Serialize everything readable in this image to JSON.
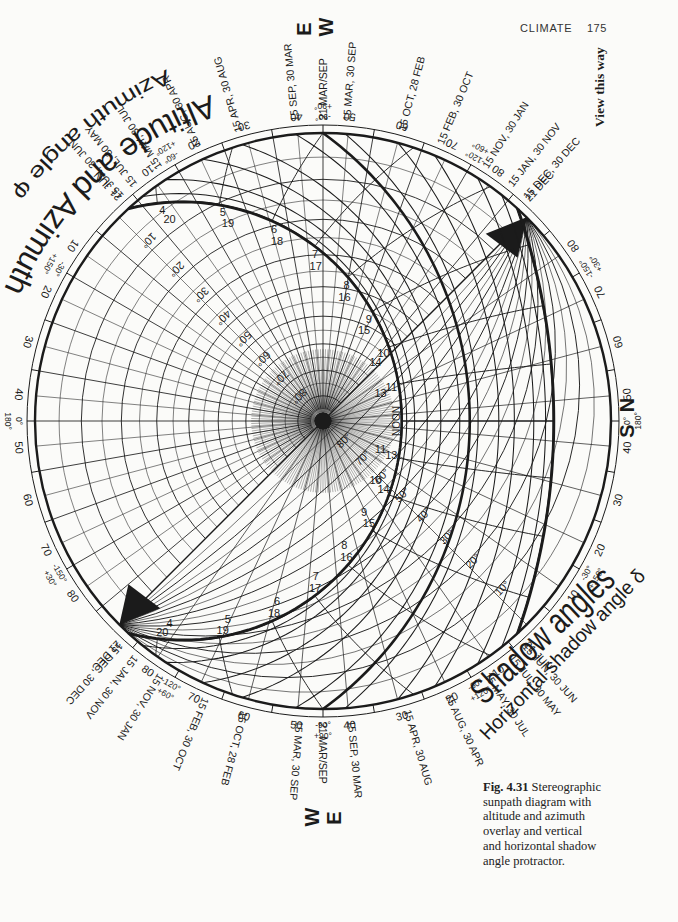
{
  "page": {
    "running_head": "CLIMATE",
    "page_number": "175",
    "view_hint": "View this way"
  },
  "compass": {
    "top": {
      "first": "E",
      "second": "W"
    },
    "right": {
      "first": "N",
      "second": "S"
    },
    "bottom": {
      "first": "W",
      "second": "E"
    }
  },
  "overlay_titles": {
    "altaz_title": "Altitude and Azimuth",
    "altaz_subtitle": "Azimuth angle φ",
    "shadow_title": "Shadow angles",
    "shadow_subtitle": "Horizontal shadow angle δ"
  },
  "caption": {
    "label": "Fig. 4.31",
    "lines": [
      "Stereographic",
      "sunpath diagram with",
      "altitude and azimuth",
      "overlay and vertical",
      "and horizontal shadow",
      "angle protractor."
    ]
  },
  "diagram": {
    "date_labels": [
      "21 JUN",
      "15 JUN, 30 JUN",
      "15 JUL, 30 MAY",
      "15 MAY, 30 JUL",
      "15 AUG, 30 APR",
      "15 APR, 30 AUG",
      "15 SEP, 30 MAR",
      "21 MAR/SEP",
      "15 MAR, 30 SEP",
      "15 OCT, 28 FEB",
      "15 FEB, 30 OCT",
      "15 NOV, 30 JAN",
      "15 JAN, 30 NOV",
      "15 DEC, 30 DEC",
      "21 DEC"
    ],
    "hour_labels": [
      "4",
      "5",
      "6",
      "7",
      "8",
      "9",
      "10",
      "11",
      "13",
      "14",
      "15",
      "16",
      "17",
      "18",
      "19",
      "20"
    ],
    "noon_label": "NOON",
    "altitude_labels": [
      "10°",
      "20°",
      "30°",
      "40°",
      "50°",
      "60°",
      "70°",
      "80°"
    ],
    "vertical_shadow_angle_labels": [
      "10°",
      "20°",
      "30°",
      "40°",
      "50°",
      "60°",
      "70°",
      "80°"
    ],
    "ring_scale": [
      "10",
      "20",
      "30",
      "40",
      "50",
      "60",
      "70",
      "80"
    ],
    "azimuth_angles": [
      {
        "inner": "0°",
        "outer": "180°"
      },
      {
        "inner": "-30°",
        "outer": "+150°"
      },
      {
        "inner": "-60°",
        "outer": "+120°"
      },
      {
        "inner": "-90°",
        "outer": "+90°"
      },
      {
        "inner": "-120°",
        "outer": "+60°"
      },
      {
        "inner": "-150°",
        "outer": "+30°"
      },
      {
        "inner": "0°",
        "outer": "180°"
      },
      {
        "inner": "-30°",
        "outer": "+150°"
      },
      {
        "inner": "-60°",
        "outer": "+120°"
      },
      {
        "inner": "-90°",
        "outer": "+90°"
      },
      {
        "inner": "-120°",
        "outer": "+60°"
      },
      {
        "inner": "-150°",
        "outer": "+30°"
      }
    ]
  }
}
